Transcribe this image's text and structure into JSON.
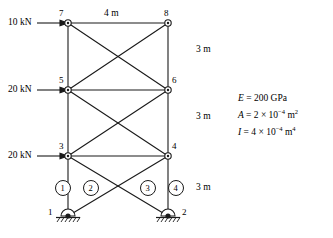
{
  "figure": {
    "loads": [
      {
        "label": "10 kN",
        "node": "7",
        "x": 8,
        "y": 19
      },
      {
        "label": "20 kN",
        "node": "5",
        "x": 8,
        "y": 86
      },
      {
        "label": "20 kN",
        "node": "3",
        "x": 8,
        "y": 152
      }
    ],
    "node_labels": [
      {
        "label": "7",
        "x": 59,
        "y": 12
      },
      {
        "label": "8",
        "x": 164,
        "y": 12
      },
      {
        "label": "5",
        "x": 59,
        "y": 79
      },
      {
        "label": "6",
        "x": 171,
        "y": 79
      },
      {
        "label": "3",
        "x": 59,
        "y": 145
      },
      {
        "label": "4",
        "x": 171,
        "y": 145
      },
      {
        "label": "1",
        "x": 47,
        "y": 210
      },
      {
        "label": "2",
        "x": 180,
        "y": 210
      }
    ],
    "dimensions": [
      {
        "label": "4 m",
        "x": 104,
        "y": 12
      },
      {
        "label": "3 m",
        "x": 196,
        "y": 48
      },
      {
        "label": "3 m",
        "x": 196,
        "y": 115
      },
      {
        "label": "3 m",
        "x": 196,
        "y": 183
      }
    ],
    "element_numbers": [
      {
        "label": "1",
        "cx": 63,
        "cy": 188
      },
      {
        "label": "2",
        "cx": 91,
        "cy": 188
      },
      {
        "label": "3",
        "cx": 148,
        "cy": 188
      },
      {
        "label": "4",
        "cx": 176,
        "cy": 188
      }
    ],
    "properties": {
      "E": {
        "symbol": "E",
        "eq": "=",
        "value": "200 GPa"
      },
      "A": {
        "symbol": "A",
        "eq": "=",
        "mantissa": "2",
        "times": "×",
        "base": "10",
        "exp": "−4",
        "unit": "m",
        "unit_exp": "2"
      },
      "I": {
        "symbol": "I",
        "eq": "=",
        "mantissa": "4",
        "times": "×",
        "base": "10",
        "exp": "−4",
        "unit": "m",
        "unit_exp": "4"
      }
    },
    "geometry": {
      "nodes": {
        "n7": [
          68,
          23
        ],
        "n8": [
          168,
          23
        ],
        "n5": [
          68,
          90
        ],
        "n6": [
          168,
          90
        ],
        "n3": [
          68,
          156
        ],
        "n4": [
          168,
          156
        ],
        "n1": [
          68,
          216
        ],
        "n2": [
          168,
          216
        ]
      },
      "stroke_color": "#1a1a1a"
    }
  }
}
